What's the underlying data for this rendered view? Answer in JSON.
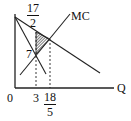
{
  "diagram": {
    "type": "monopoly-deadweight-loss",
    "axes": {
      "x_label": "Q",
      "origin_label": "0"
    },
    "curves": {
      "mc_label": "MC"
    },
    "labels": {
      "price_top": {
        "num": "17",
        "den": "2"
      },
      "price_mr_mc": "7",
      "q_monopoly": "3",
      "q_competitive": {
        "num": "18",
        "den": "5"
      }
    },
    "colors": {
      "line": "#222222",
      "shade": "#333333",
      "background": "#ffffff"
    }
  }
}
